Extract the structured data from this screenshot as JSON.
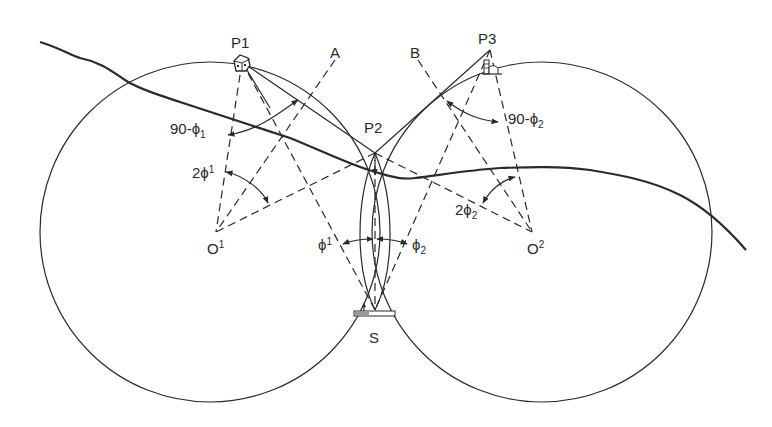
{
  "figure": {
    "labels": {
      "p1": "P1",
      "p2": "P2",
      "p3": "P3",
      "a": "A",
      "b": "B",
      "s": "S",
      "o1": "O",
      "o1_sup": "1",
      "o2": "O",
      "o2_sup": "2",
      "angle_90_phi1": "90-ϕ",
      "angle_90_phi1_sub": "1",
      "angle_90_phi2": "90-ϕ",
      "angle_90_phi2_sub": "2",
      "angle_2phi1": "2ϕ",
      "angle_2phi1_sup": "1",
      "angle_2phi2": "2ϕ",
      "angle_2phi2_sub": "2",
      "angle_phi1": "ϕ",
      "angle_phi1_sup": "1",
      "angle_phi2": "ϕ",
      "angle_phi2_sub": "2"
    },
    "icons": {
      "p1": "house-icon",
      "p3": "tower-building-icon",
      "s": "ship-station-icon"
    },
    "colors": {
      "ink": "#2a2a2a",
      "background": "#ffffff"
    }
  }
}
